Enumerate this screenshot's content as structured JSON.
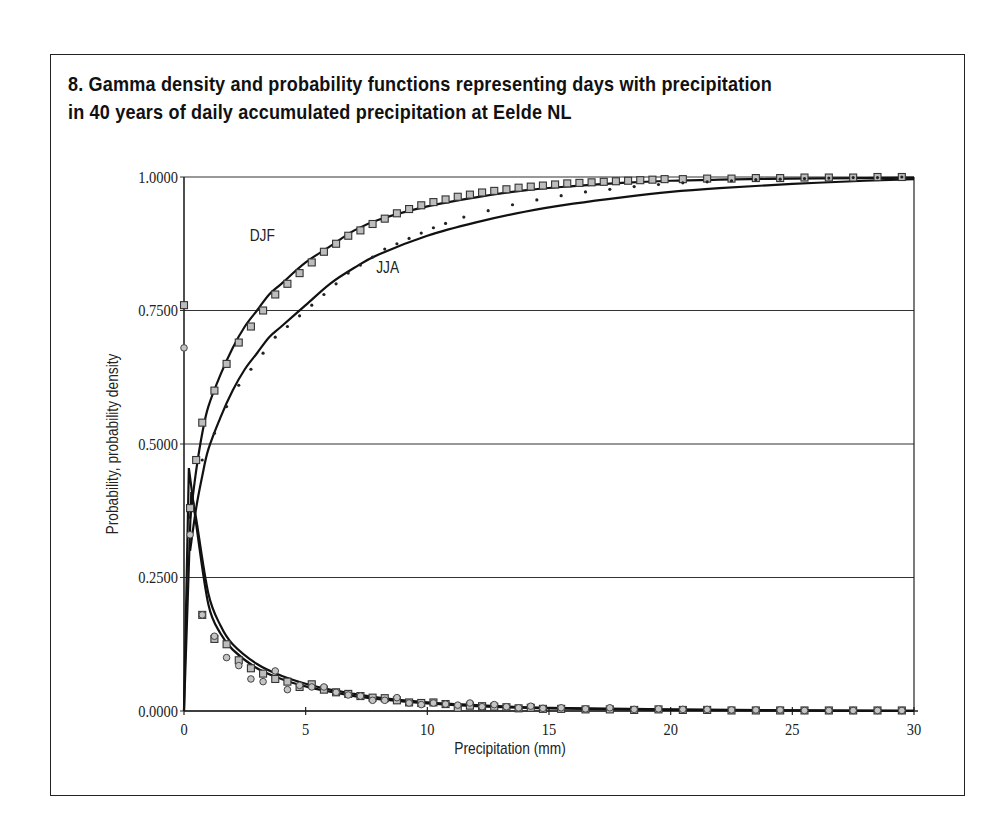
{
  "figure": {
    "title_line1": "8.  Gamma density and probability functions representing days with precipitation",
    "title_line2": "in 40 years of daily accumulated precipitation at Eelde NL"
  },
  "chart_data": {
    "type": "line",
    "title": "8. Gamma density and probability functions representing days with precipitation in 40 years of daily accumulated precipitation at Eelde NL",
    "xlabel": "Precipitation (mm)",
    "ylabel": "Probability, probability density",
    "xlim": [
      0,
      30
    ],
    "ylim": [
      0,
      1
    ],
    "x_ticks": [
      "0",
      "5",
      "10",
      "15",
      "20",
      "25",
      "30"
    ],
    "y_ticks": [
      "0.0000",
      "0.2500",
      "0.5000",
      "0.7500",
      "1.0000"
    ],
    "grid": "horizontal",
    "annotations": [
      {
        "text": "DJF",
        "x": 2.7,
        "y": 0.88
      },
      {
        "text": "JJA",
        "x": 7.9,
        "y": 0.82
      }
    ],
    "series": [
      {
        "name": "DJF cumulative probability (gamma fit)",
        "style": "solid line",
        "x": [
          0.25,
          0.5,
          0.75,
          1,
          1.5,
          2,
          2.5,
          3,
          3.5,
          4,
          5,
          6,
          7,
          8,
          10,
          12,
          14,
          16,
          18,
          20,
          22,
          25,
          28,
          30
        ],
        "values": [
          0.36,
          0.45,
          0.52,
          0.57,
          0.63,
          0.68,
          0.72,
          0.75,
          0.78,
          0.8,
          0.84,
          0.87,
          0.9,
          0.92,
          0.945,
          0.962,
          0.975,
          0.983,
          0.989,
          0.993,
          0.995,
          0.997,
          0.998,
          0.999
        ]
      },
      {
        "name": "DJF observed cumulative (squares)",
        "style": "gray squares",
        "x": [
          0.25,
          0.5,
          0.75,
          1.25,
          1.75,
          2.25,
          2.75,
          3.25,
          3.75,
          4.25,
          4.75,
          5.25,
          5.75,
          6.25,
          6.75,
          7.25,
          7.75,
          8.25,
          8.75,
          9.25,
          9.75,
          10.25,
          10.75,
          11.25,
          11.75,
          12.25,
          12.75,
          13.25,
          13.75,
          14.25,
          14.75,
          15.25,
          15.75,
          16.25,
          16.75,
          17.25,
          17.75,
          18.25,
          18.75,
          19.25,
          19.75,
          20.5,
          21.5,
          22.5,
          23.5,
          24.5,
          25.5,
          26.5,
          27.5,
          28.5,
          29.5
        ],
        "values": [
          0.38,
          0.47,
          0.54,
          0.6,
          0.65,
          0.69,
          0.72,
          0.75,
          0.78,
          0.8,
          0.82,
          0.84,
          0.86,
          0.875,
          0.89,
          0.9,
          0.912,
          0.922,
          0.932,
          0.94,
          0.947,
          0.953,
          0.958,
          0.963,
          0.967,
          0.971,
          0.974,
          0.977,
          0.98,
          0.982,
          0.984,
          0.986,
          0.988,
          0.989,
          0.99,
          0.991,
          0.992,
          0.993,
          0.994,
          0.995,
          0.996,
          0.996,
          0.997,
          0.997,
          0.998,
          0.998,
          0.999,
          0.999,
          0.999,
          1.0,
          1.0
        ]
      },
      {
        "name": "JJA cumulative probability (gamma fit)",
        "style": "solid line",
        "x": [
          0.25,
          0.5,
          0.75,
          1,
          1.5,
          2,
          2.5,
          3,
          3.5,
          4,
          5,
          6,
          7,
          8,
          10,
          12,
          14,
          16,
          18,
          20,
          22,
          25,
          28,
          30
        ],
        "values": [
          0.3,
          0.38,
          0.44,
          0.49,
          0.55,
          0.6,
          0.64,
          0.67,
          0.7,
          0.72,
          0.76,
          0.8,
          0.83,
          0.855,
          0.89,
          0.915,
          0.935,
          0.95,
          0.962,
          0.972,
          0.979,
          0.987,
          0.993,
          0.996
        ]
      },
      {
        "name": "JJA observed cumulative (dots)",
        "style": "small dots",
        "x": [
          0.75,
          1.25,
          1.75,
          2.25,
          2.75,
          3.25,
          3.75,
          4.25,
          4.75,
          5.25,
          5.75,
          6.25,
          6.75,
          7.25,
          7.75,
          8.25,
          8.75,
          9.25,
          9.75,
          10.25,
          10.75,
          11.5,
          12.5,
          13.5,
          14.5,
          15.5,
          16.5,
          17.5,
          18.5,
          19.5,
          20.5,
          21.5,
          22.5,
          23.5,
          24.5,
          25.5,
          26.5,
          27.5,
          28.5,
          29.5
        ],
        "values": [
          0.47,
          0.52,
          0.57,
          0.61,
          0.64,
          0.67,
          0.7,
          0.72,
          0.74,
          0.76,
          0.78,
          0.8,
          0.82,
          0.835,
          0.85,
          0.865,
          0.875,
          0.885,
          0.895,
          0.905,
          0.913,
          0.925,
          0.937,
          0.948,
          0.957,
          0.965,
          0.972,
          0.977,
          0.982,
          0.986,
          0.989,
          0.991,
          0.993,
          0.995,
          0.996,
          0.997,
          0.998,
          0.999,
          0.999,
          1.0
        ]
      },
      {
        "name": "DJF probability density (gamma fit)",
        "style": "solid line",
        "x": [
          0,
          0.2,
          0.5,
          1,
          1.5,
          2,
          3,
          4,
          5,
          6,
          7,
          8,
          10,
          12,
          15,
          20,
          25,
          30
        ],
        "values": [
          0,
          0.455,
          0.35,
          0.2,
          0.145,
          0.115,
          0.08,
          0.06,
          0.046,
          0.036,
          0.028,
          0.022,
          0.014,
          0.009,
          0.005,
          0.002,
          0.001,
          0.0005
        ]
      },
      {
        "name": "JJA probability density (gamma fit)",
        "style": "solid line",
        "x": [
          0,
          0.3,
          0.5,
          1,
          1.5,
          2,
          3,
          4,
          5,
          6,
          7,
          8,
          10,
          12,
          15,
          20,
          25,
          30
        ],
        "values": [
          0,
          0.41,
          0.36,
          0.22,
          0.16,
          0.125,
          0.088,
          0.066,
          0.051,
          0.04,
          0.032,
          0.025,
          0.016,
          0.011,
          0.006,
          0.003,
          0.001,
          0.0005
        ]
      },
      {
        "name": "DJF observed density (squares)",
        "style": "gray squares",
        "x": [
          0,
          0.25,
          0.75,
          1.25,
          1.75,
          2.25,
          2.75,
          3.25,
          3.75,
          4.25,
          4.75,
          5.25,
          5.75,
          6.25,
          6.75,
          7.25,
          7.75,
          8.25,
          8.75,
          9.25,
          9.75,
          10.25,
          10.75,
          11.25,
          11.75,
          12.25,
          12.75,
          13.25,
          13.75,
          14.25,
          14.75,
          15.5,
          16.5,
          17.5,
          18.5,
          19.5,
          20.5,
          21.5,
          22.5,
          23.5,
          24.5,
          25.5,
          26.5,
          27.5,
          28.5,
          29.5
        ],
        "values": [
          0.76,
          0.38,
          0.18,
          0.135,
          0.125,
          0.095,
          0.08,
          0.07,
          0.06,
          0.055,
          0.045,
          0.05,
          0.04,
          0.035,
          0.032,
          0.028,
          0.025,
          0.024,
          0.02,
          0.016,
          0.015,
          0.016,
          0.013,
          0.006,
          0.01,
          0.009,
          0.008,
          0.007,
          0.005,
          0.006,
          0.004,
          0.004,
          0.003,
          0.003,
          0.002,
          0.003,
          0.002,
          0.002,
          0.001,
          0.001,
          0.001,
          0.001,
          0.001,
          0.001,
          0.001,
          0.001
        ]
      },
      {
        "name": "JJA observed density (circles)",
        "style": "gray circles",
        "x": [
          0,
          0.25,
          0.75,
          1.25,
          1.75,
          2.25,
          2.75,
          3.25,
          3.75,
          4.25,
          4.75,
          5.25,
          5.75,
          6.25,
          6.75,
          7.25,
          7.75,
          8.25,
          8.75,
          9.25,
          9.75,
          10.25,
          10.75,
          11.25,
          11.75,
          12.25,
          12.75,
          13.25,
          13.75,
          14.25,
          14.75,
          15.5,
          16.5,
          17.5,
          18.5,
          19.5,
          20.5,
          21.5,
          22.5,
          23.5,
          24.5,
          25.5,
          26.5,
          27.5,
          28.5,
          29.5
        ],
        "values": [
          0.68,
          0.33,
          0.18,
          0.14,
          0.1,
          0.085,
          0.06,
          0.055,
          0.075,
          0.04,
          0.048,
          0.045,
          0.045,
          0.035,
          0.03,
          0.028,
          0.02,
          0.02,
          0.025,
          0.015,
          0.012,
          0.015,
          0.013,
          0.011,
          0.015,
          0.008,
          0.012,
          0.008,
          0.006,
          0.009,
          0.005,
          0.006,
          0.004,
          0.006,
          0.003,
          0.004,
          0.003,
          0.003,
          0.002,
          0.002,
          0.002,
          0.001,
          0.001,
          0.001,
          0.001,
          0.001
        ]
      }
    ]
  }
}
